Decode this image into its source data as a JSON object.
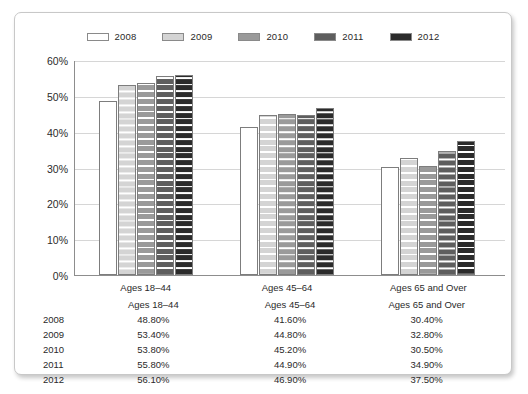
{
  "chart_data": {
    "type": "bar",
    "title": "",
    "xlabel": "",
    "ylabel": "",
    "ylim": [
      0,
      60
    ],
    "yticks": [
      "0%",
      "10%",
      "20%",
      "30%",
      "40%",
      "50%",
      "60%"
    ],
    "grid": true,
    "legend_position": "top-center",
    "categories": [
      "Ages 18–44",
      "Ages 45–64",
      "Ages 65 and Over"
    ],
    "series": [
      {
        "name": "2008",
        "color": "#ffffff",
        "values": [
          48.8,
          41.6,
          30.4
        ],
        "labels": [
          "48.80%",
          "41.60%",
          "30.40%"
        ]
      },
      {
        "name": "2009",
        "color": "#d4d4d4",
        "values": [
          53.4,
          44.8,
          32.8
        ],
        "labels": [
          "53.40%",
          "44.80%",
          "32.80%"
        ]
      },
      {
        "name": "2010",
        "color": "#9a9a9a",
        "values": [
          53.8,
          45.2,
          30.5
        ],
        "labels": [
          "53.80%",
          "45.20%",
          "30.50%"
        ]
      },
      {
        "name": "2011",
        "color": "#5e5e5e",
        "values": [
          55.8,
          44.9,
          34.9
        ],
        "labels": [
          "55.80%",
          "44.90%",
          "34.90%"
        ]
      },
      {
        "name": "2012",
        "color": "#2b2b2b",
        "values": [
          56.1,
          46.9,
          37.5
        ],
        "labels": [
          "56.10%",
          "46.90%",
          "37.50%"
        ]
      }
    ]
  },
  "legend": {
    "items": [
      {
        "label": "2008"
      },
      {
        "label": "2009"
      },
      {
        "label": "2010"
      },
      {
        "label": "2011"
      },
      {
        "label": "2012"
      }
    ]
  },
  "axis": {
    "yticks": [
      {
        "label": "60%"
      },
      {
        "label": "50%"
      },
      {
        "label": "40%"
      },
      {
        "label": "30%"
      },
      {
        "label": "20%"
      },
      {
        "label": "10%"
      },
      {
        "label": "0%"
      }
    ]
  },
  "table": {
    "header": {
      "corner": "",
      "columns": [
        "Ages 18–44",
        "Ages 45–64",
        "Ages 65 and Over"
      ]
    },
    "rows": [
      {
        "year": "2008",
        "values": [
          "48.80%",
          "41.60%",
          "30.40%"
        ]
      },
      {
        "year": "2009",
        "values": [
          "53.40%",
          "44.80%",
          "32.80%"
        ]
      },
      {
        "year": "2010",
        "values": [
          "53.80%",
          "45.20%",
          "30.50%"
        ]
      },
      {
        "year": "2011",
        "values": [
          "55.80%",
          "44.90%",
          "34.90%"
        ]
      },
      {
        "year": "2012",
        "values": [
          "56.10%",
          "46.90%",
          "37.50%"
        ]
      }
    ]
  }
}
